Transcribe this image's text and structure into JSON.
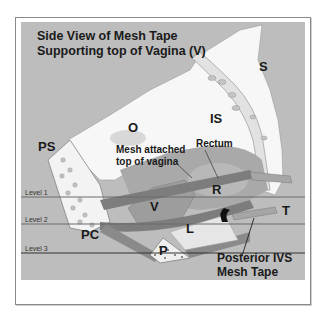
{
  "title": {
    "line1": "Side View of Mesh Tape",
    "line2": "Supporting top of Vagina (V)"
  },
  "labels": {
    "S": "S",
    "O": "O",
    "IS": "IS",
    "PS": "PS",
    "rectum": "Rectum",
    "R": "R",
    "mesh_attached_1": "Mesh attached",
    "mesh_attached_2": "top of vagina",
    "V": "V",
    "T": "T",
    "PC": "PC",
    "L": "L",
    "P": "P",
    "posterior_1": "Posterior IVS",
    "posterior_2": "Mesh Tape"
  },
  "levels": [
    "Level 1",
    "Level 2",
    "Level 3"
  ],
  "colors": {
    "panel": "#bdbdbd",
    "bone": "#f7f7f7",
    "muscle": "#8c8c8c",
    "dark_muscle": "#6e6e6e",
    "line": "#555555"
  }
}
